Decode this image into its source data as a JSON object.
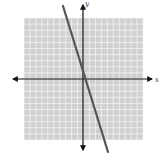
{
  "chart_data": {
    "type": "line",
    "title": "",
    "xlabel": "x",
    "ylabel": "y",
    "xlim": [
      -10,
      10
    ],
    "ylim": [
      -10,
      10
    ],
    "grid": true,
    "grid_step": 1,
    "series": [
      {
        "name": "line",
        "equation": "y = -3x + 1",
        "slope": -3,
        "intercept": 1,
        "x": [
          -3.4,
          4.1
        ],
        "y": [
          11.2,
          -11.3
        ]
      }
    ]
  },
  "labels": {
    "x_axis": "x",
    "y_axis": "y"
  },
  "colors": {
    "grid_background": "#d0d0d0",
    "grid_lines": "#f4f4f4",
    "axes": "#111111",
    "line": "#555555"
  }
}
